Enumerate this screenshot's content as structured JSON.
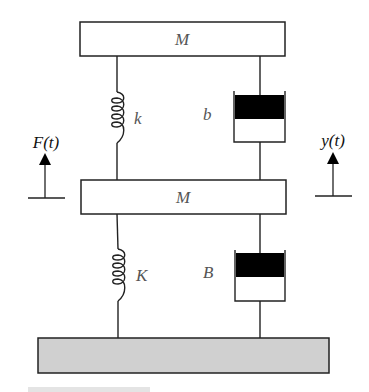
{
  "diagram": {
    "type": "two-mass spring-damper system",
    "colors": {
      "stroke": "#222222",
      "ground_fill": "#d0d0d0",
      "piston_fill": "#000000",
      "label": "#555555"
    },
    "top_mass": {
      "label": "M"
    },
    "bottom_mass": {
      "label": "M"
    },
    "upper_spring": {
      "label": "k"
    },
    "upper_damper": {
      "label": "b"
    },
    "lower_spring": {
      "label": "K"
    },
    "lower_damper": {
      "label": "B"
    },
    "force_input": {
      "label": "F(t)"
    },
    "displacement_output": {
      "label": "y(t)"
    },
    "ground": {
      "label": ""
    }
  }
}
